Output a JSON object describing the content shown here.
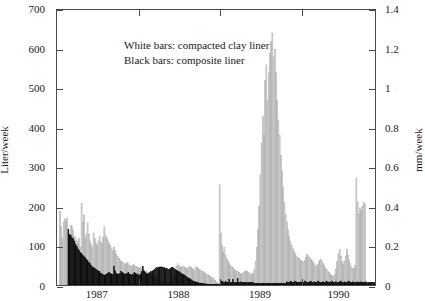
{
  "chart_data": {
    "type": "bar",
    "title": "",
    "subtitle": "",
    "xlabel": "",
    "ylabel": "Liter/week",
    "y2label": "mm/week",
    "ylim": [
      0,
      700
    ],
    "y2lim": [
      0,
      1.4
    ],
    "xlim": [
      1987.0,
      1990.92
    ],
    "grid": false,
    "legend_position": "upper-left-inside",
    "yticks": [
      0,
      100,
      200,
      300,
      400,
      500,
      600,
      700
    ],
    "ytick_labels": [
      "0",
      "100",
      "200",
      "300",
      "400",
      "500",
      "600",
      "700"
    ],
    "y2ticks": [
      0,
      0.2,
      0.4,
      0.6,
      0.8,
      1.0,
      1.2,
      1.4
    ],
    "y2tick_labels": [
      "0",
      "0.2",
      "0.4",
      "0.6",
      "0.8",
      "1",
      "1.2",
      "1.4"
    ],
    "xticks": [
      1987,
      1988,
      1989,
      1990
    ],
    "xtick_labels": [
      "1987",
      "1988",
      "1989",
      "1990"
    ],
    "annotations": [
      "White bars: compacted clay liner",
      "Black bars: composite liner"
    ],
    "series": [
      {
        "name": "compacted clay liner",
        "style": "white-bar",
        "fill": "#ffffff",
        "edge": "#9a9a9a",
        "units": "Liter/week",
        "values": [
          0,
          0,
          188,
          150,
          120,
          160,
          168,
          163,
          170,
          142,
          130,
          152,
          148,
          138,
          124,
          120,
          112,
          105,
          118,
          96,
          207,
          160,
          178,
          120,
          130,
          158,
          128,
          112,
          104,
          96,
          132,
          118,
          106,
          100,
          112,
          124,
          110,
          104,
          122,
          148,
          126,
          118,
          112,
          106,
          100,
          92,
          86,
          96,
          88,
          78,
          72,
          68,
          64,
          60,
          58,
          56,
          54,
          52,
          58,
          54,
          50,
          48,
          46,
          52,
          50,
          48,
          46,
          44,
          42,
          44,
          42,
          40,
          38,
          36,
          34,
          32,
          30,
          28,
          26,
          24,
          22,
          20,
          18,
          16,
          14,
          12,
          10,
          8,
          8,
          6,
          6,
          4,
          4,
          6,
          8,
          10,
          14,
          22,
          36,
          48,
          54,
          50,
          46,
          44,
          48,
          46,
          44,
          42,
          40,
          44,
          48,
          44,
          42,
          40,
          38,
          44,
          46,
          42,
          40,
          38,
          36,
          34,
          32,
          30,
          28,
          26,
          24,
          22,
          20,
          18,
          16,
          12,
          8,
          6,
          4,
          255,
          132,
          100,
          84,
          96,
          76,
          66,
          60,
          56,
          50,
          46,
          44,
          40,
          38,
          36,
          34,
          32,
          30,
          28,
          30,
          32,
          34,
          36,
          34,
          32,
          30,
          28,
          26,
          30,
          40,
          60,
          95,
          140,
          200,
          280,
          360,
          430,
          380,
          520,
          560,
          470,
          540,
          590,
          620,
          640,
          580,
          600,
          540,
          470,
          420,
          380,
          330,
          290,
          250,
          210,
          180,
          160,
          140,
          125,
          110,
          100,
          92,
          86,
          80,
          74,
          70,
          68,
          64,
          62,
          60,
          58,
          62,
          70,
          78,
          74,
          70,
          66,
          62,
          58,
          54,
          50,
          46,
          52,
          60,
          66,
          62,
          56,
          50,
          44,
          40,
          36,
          32,
          28,
          26,
          24,
          22,
          28,
          40,
          60,
          78,
          90,
          72,
          60,
          52,
          60,
          72,
          90,
          76,
          62,
          54,
          46,
          40,
          42,
          50,
          272,
          210,
          180,
          196,
          190,
          200,
          210,
          205
        ]
      },
      {
        "name": "composite liner",
        "style": "black-bar",
        "fill": "#000000",
        "edge": "#000000",
        "units": "Liter/week",
        "values": [
          0,
          0,
          0,
          0,
          0,
          0,
          0,
          0,
          0,
          142,
          128,
          126,
          120,
          118,
          112,
          104,
          98,
          92,
          88,
          82,
          80,
          76,
          72,
          70,
          66,
          62,
          58,
          54,
          50,
          46,
          44,
          42,
          40,
          38,
          36,
          34,
          30,
          28,
          26,
          24,
          26,
          28,
          30,
          32,
          30,
          28,
          26,
          48,
          36,
          30,
          28,
          26,
          30,
          34,
          32,
          30,
          28,
          26,
          30,
          32,
          28,
          26,
          24,
          28,
          32,
          30,
          28,
          26,
          24,
          28,
          34,
          48,
          36,
          32,
          30,
          28,
          30,
          32,
          34,
          36,
          38,
          40,
          42,
          44,
          44,
          46,
          46,
          46,
          44,
          44,
          42,
          42,
          40,
          40,
          42,
          44,
          44,
          42,
          40,
          38,
          36,
          34,
          32,
          30,
          28,
          26,
          24,
          22,
          20,
          18,
          16,
          14,
          12,
          10,
          9,
          8,
          7,
          6,
          5,
          5,
          4,
          4,
          3,
          3,
          3,
          2,
          2,
          2,
          2,
          2,
          2,
          2,
          2,
          2,
          2,
          2,
          10,
          10,
          8,
          6,
          10,
          6,
          6,
          14,
          6,
          6,
          14,
          6,
          6,
          6,
          16,
          6,
          6,
          8,
          6,
          6,
          6,
          6,
          6,
          6,
          6,
          6,
          6,
          6,
          4,
          4,
          4,
          4,
          4,
          4,
          4,
          4,
          4,
          4,
          4,
          4,
          4,
          4,
          4,
          4,
          4,
          4,
          4,
          4,
          4,
          4,
          4,
          4,
          4,
          4,
          4,
          8,
          6,
          6,
          10,
          8,
          6,
          6,
          10,
          8,
          6,
          6,
          6,
          8,
          6,
          6,
          10,
          8,
          6,
          6,
          8,
          10,
          6,
          6,
          8,
          6,
          6,
          10,
          8,
          6,
          6,
          8,
          6,
          6,
          10,
          8,
          6,
          6,
          8,
          10,
          6,
          6,
          8,
          6,
          6,
          8,
          10,
          6,
          6,
          8,
          6,
          6,
          8,
          10,
          6,
          6,
          8,
          6,
          6,
          6,
          8,
          6,
          6,
          8,
          6,
          6,
          6,
          8,
          6,
          6,
          6,
          6,
          6,
          6,
          6
        ]
      }
    ]
  }
}
